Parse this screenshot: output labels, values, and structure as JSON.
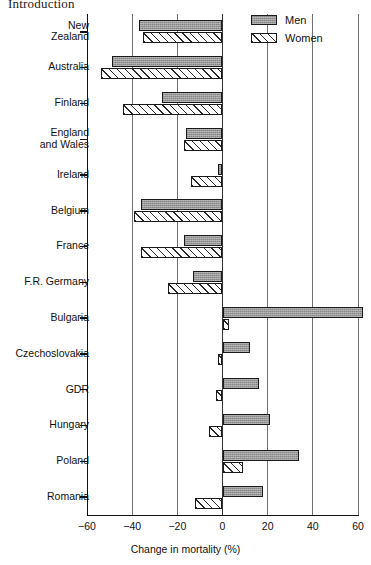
{
  "page": {
    "running_head": "Introduction"
  },
  "legend": {
    "position": "top-right",
    "entries": [
      {
        "key": "men",
        "label": "Men",
        "swatch": "grey-shaded-swatch"
      },
      {
        "key": "women",
        "label": "Women",
        "swatch": "diagonal-hatched-swatch"
      }
    ]
  },
  "axes": {
    "x_title": "Change in mortality (%)",
    "x_ticks": [
      -60,
      -40,
      -20,
      0,
      20,
      40,
      60
    ],
    "x_tick_labels": [
      "−60",
      "−40",
      "−20",
      "0",
      "20",
      "40",
      "60"
    ],
    "y_title": ""
  },
  "chart_data": {
    "type": "bar",
    "orientation": "horizontal",
    "title": "",
    "subtitle": "",
    "xlabel": "Change in mortality (%)",
    "ylabel": "",
    "xlim": [
      -60,
      60
    ],
    "xticks": [
      -60,
      -40,
      -20,
      0,
      20,
      40,
      60
    ],
    "grid": true,
    "grid_axis": "x",
    "legend": [
      "Men",
      "Women"
    ],
    "legend_position": "top-right",
    "categories": [
      "New Zealand",
      "Australia",
      "Finland",
      "England and Wales",
      "Ireland",
      "Belgium",
      "France",
      "F.R. Germany",
      "Bulgaria",
      "Czechoslovakia",
      "GDR",
      "Hungary",
      "Poland",
      "Romania"
    ],
    "series": [
      {
        "name": "Men",
        "values": [
          -37,
          -49,
          -27,
          -16,
          -2,
          -36,
          -17,
          -13,
          62,
          12,
          16,
          21,
          34,
          18
        ]
      },
      {
        "name": "Women",
        "values": [
          -35,
          -54,
          -44,
          -17,
          -14,
          -39,
          -36,
          -24,
          3,
          -2,
          -3,
          -6,
          9,
          -12
        ]
      }
    ]
  },
  "colors": {
    "men_fill": "#9a9a9a",
    "women_fill": "#ffffff",
    "bar_outline": "#1a1a1a",
    "axis": "#111111",
    "gridline": "#6f6f6f"
  }
}
